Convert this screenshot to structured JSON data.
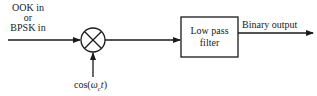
{
  "diagram": {
    "type": "block-diagram",
    "input": {
      "label_lines": [
        "OOK in",
        "or",
        "BPSK in"
      ]
    },
    "mixer": {
      "symbol": "multiplier-circle-x",
      "carrier_label": {
        "prefix": "cos(",
        "omega": "ω",
        "subscript": "c",
        "var": "t",
        "suffix": ")"
      }
    },
    "filter": {
      "label_lines": [
        "Low pass",
        "filter"
      ]
    },
    "output": {
      "label": "Binary output"
    },
    "colors": {
      "stroke": "#1a1a1a",
      "background": "#ffffff"
    }
  }
}
